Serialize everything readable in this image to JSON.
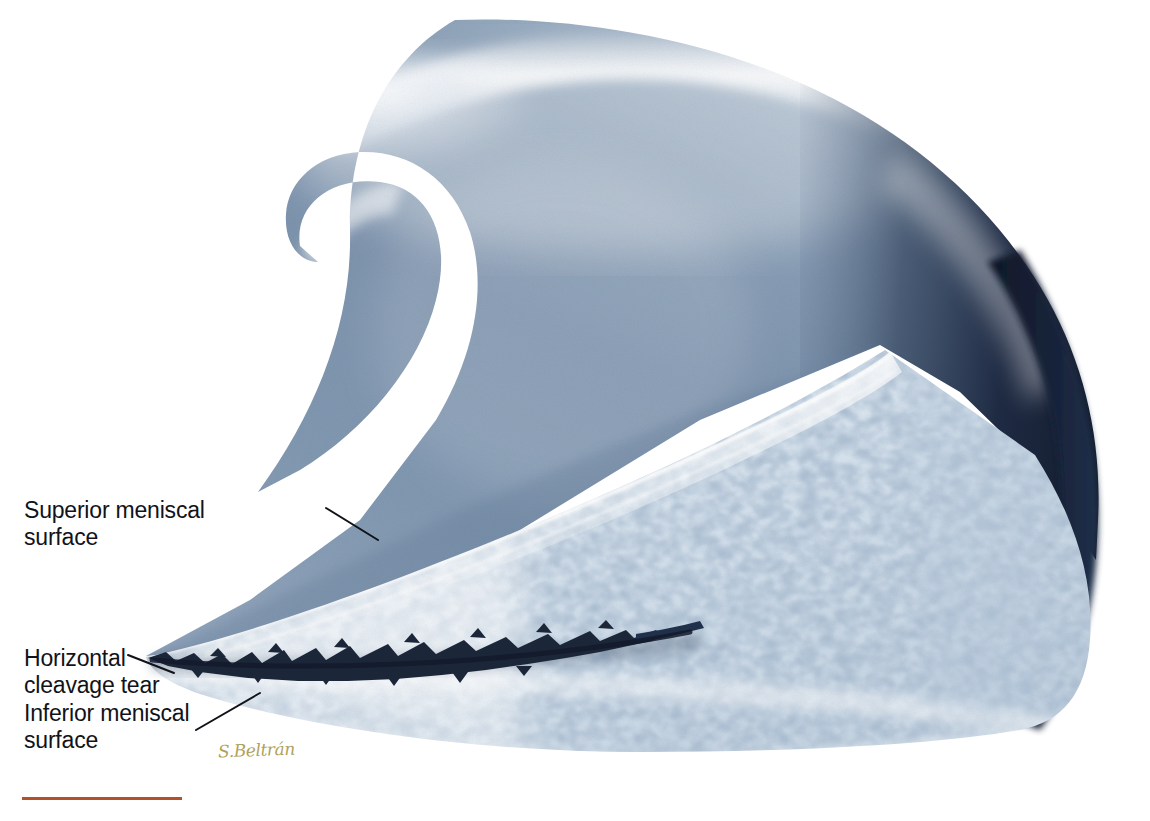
{
  "figure": {
    "type": "medical-illustration",
    "background_color": "#ffffff",
    "width": 1150,
    "height": 821
  },
  "labels": {
    "superior": "Superior meniscal\nsurface",
    "tear": "Horizontal\ncleavage tear",
    "inferior": "Inferior meniscal\nsurface"
  },
  "credit": {
    "signature": "S.Beltrán"
  },
  "palette": {
    "body_mid": "#7e93ad",
    "body_highlight": "#f2f6fa",
    "body_shadow": "#2c3d55",
    "edge_dark": "#141d33",
    "matrix_pale": "#e7eef5",
    "matrix_blue": "#c3d3e2",
    "cell_blue": "#8ba3bb",
    "cell_deep": "#5d7894",
    "tear_dark": "#1b2639",
    "label_text": "#111318",
    "leader_line": "#111318",
    "signature_gold": "#b0a25c",
    "rule_red": "#b2512a"
  },
  "anatomy": {
    "regions": [
      {
        "name": "superior-meniscal-body",
        "description": "hook-shaped smooth superior portion with specular highlight"
      },
      {
        "name": "cut-face-wedge",
        "description": "triangular sectioned face showing chondrocyte lacunae texture"
      },
      {
        "name": "horizontal-cleavage-tear",
        "description": "jagged dark fissure splitting the wedge horizontally"
      },
      {
        "name": "inferior-meniscal-surface",
        "description": "smooth curved lower border of the wedge"
      },
      {
        "name": "posterior-dark-rim",
        "description": "dark navy shadowed outer rim at right"
      }
    ]
  },
  "leader_lines": [
    {
      "name": "leader-superior",
      "from": [
        326,
        508
      ],
      "to": [
        378,
        540
      ]
    },
    {
      "name": "leader-tear",
      "from": [
        128,
        655
      ],
      "to": [
        172,
        672
      ]
    },
    {
      "name": "leader-inferior",
      "from": [
        196,
        730
      ],
      "to": [
        258,
        694
      ]
    }
  ],
  "rule": {
    "name": "bottom-rule",
    "color": "#b2512a",
    "width": 160
  }
}
